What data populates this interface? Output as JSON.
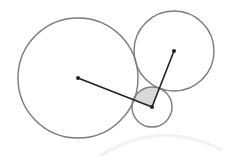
{
  "diagram": {
    "type": "tangent-circles",
    "width": 249,
    "height": 156,
    "colors": {
      "background": "#ffffff",
      "circle_stroke": "#7a7a7a",
      "segment_stroke": "#222222",
      "point_fill": "#222222",
      "sector_fill": "#d9d9d9",
      "faint_arc": "#f2f2f2"
    },
    "circles": [
      {
        "name": "large-circle",
        "cx": 78,
        "cy": 78,
        "r": 60
      },
      {
        "name": "upper-right-circle",
        "cx": 174,
        "cy": 51,
        "r": 40
      },
      {
        "name": "small-circle",
        "cx": 152,
        "cy": 107,
        "r": 20
      }
    ],
    "segments": [
      {
        "name": "segment-large-to-small",
        "x1": 78,
        "y1": 78,
        "x2": 152,
        "y2": 107
      },
      {
        "name": "segment-small-to-upper-right",
        "x1": 152,
        "y1": 107,
        "x2": 174,
        "y2": 51
      }
    ],
    "centers": [
      {
        "name": "center-large",
        "x": 78,
        "y": 78
      },
      {
        "name": "center-upper-right",
        "x": 174,
        "y": 51
      },
      {
        "name": "center-small",
        "x": 152,
        "y": 107
      }
    ],
    "shaded_sector": {
      "cx": 152,
      "cy": 107,
      "r": 20,
      "description": "angle between the two segments at the small circle's center"
    }
  }
}
